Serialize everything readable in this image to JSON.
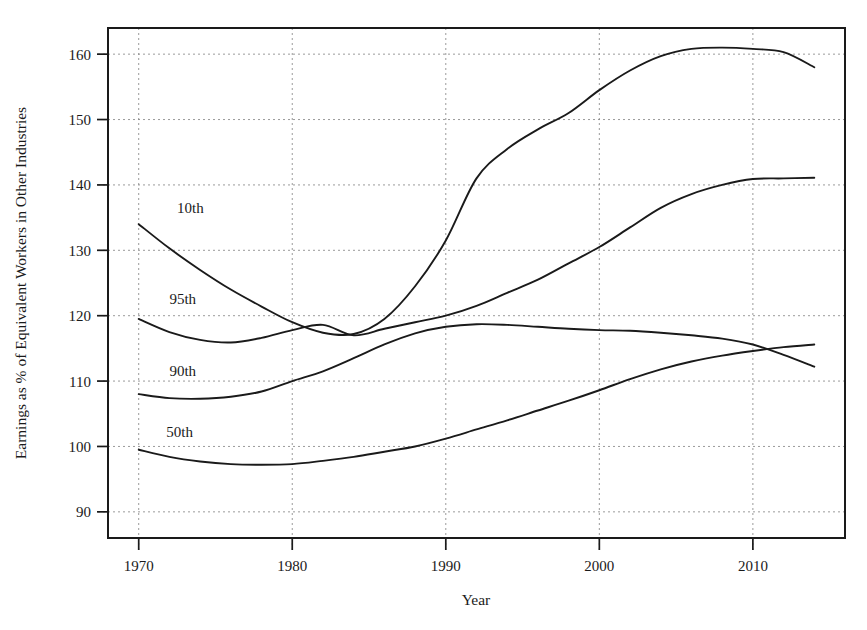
{
  "chart_data": {
    "type": "line",
    "title": "",
    "subtitle": "",
    "xlabel": "Year",
    "ylabel": "Earnings as % of Equivalent Workers in Other Industries",
    "xlim": [
      1968,
      2016
    ],
    "ylim": [
      86,
      164
    ],
    "xticks": [
      1970,
      1980,
      1990,
      2000,
      2010
    ],
    "xticklabels": [
      "1970",
      "1980",
      "1990",
      "2000",
      "2010"
    ],
    "yticks": [
      90,
      100,
      110,
      120,
      130,
      140,
      150,
      160
    ],
    "yticklabels": [
      "90",
      "100",
      "110",
      "120",
      "130",
      "140",
      "150",
      "160"
    ],
    "grid": true,
    "grid_style": "dotted",
    "legend": "inline-labels",
    "line_color": "#1a1a1a",
    "x": [
      1970,
      1972,
      1974,
      1976,
      1978,
      1980,
      1982,
      1984,
      1986,
      1988,
      1990,
      1992,
      1994,
      1996,
      1998,
      2000,
      2002,
      2004,
      2006,
      2008,
      2010,
      2012,
      2014
    ],
    "series": [
      {
        "name": "10th",
        "label": "10th",
        "label_x": 1972.5,
        "label_y": 136.5,
        "values": [
          134.0,
          130.3,
          127.0,
          124.0,
          121.4,
          119.0,
          117.4,
          117.2,
          119.5,
          124.5,
          131.5,
          141.0,
          145.5,
          148.5,
          151.0,
          154.5,
          157.5,
          159.7,
          160.8,
          161.0,
          160.8,
          160.3,
          158.0
        ]
      },
      {
        "name": "95th",
        "label": "95th",
        "label_x": 1972.0,
        "label_y": 122.5,
        "values": [
          119.5,
          117.5,
          116.3,
          115.9,
          116.6,
          117.8,
          118.6,
          117.0,
          118.0,
          119.0,
          120.0,
          121.5,
          123.5,
          125.5,
          128.0,
          130.5,
          133.5,
          136.5,
          138.6,
          140.0,
          140.9,
          141.0,
          141.1
        ]
      },
      {
        "name": "90th",
        "label": "90th",
        "label_x": 1972.0,
        "label_y": 111.5,
        "values": [
          108.0,
          107.4,
          107.3,
          107.6,
          108.4,
          110.0,
          111.5,
          113.5,
          115.6,
          117.3,
          118.3,
          118.7,
          118.6,
          118.3,
          118.0,
          117.8,
          117.7,
          117.4,
          117.0,
          116.5,
          115.6,
          114.0,
          112.2
        ]
      },
      {
        "name": "50th",
        "label": "50th",
        "label_x": 1971.8,
        "label_y": 102.2,
        "values": [
          99.5,
          98.4,
          97.7,
          97.3,
          97.2,
          97.3,
          97.8,
          98.4,
          99.2,
          100.0,
          101.2,
          102.6,
          104.0,
          105.5,
          107.0,
          108.6,
          110.3,
          111.8,
          113.0,
          113.9,
          114.6,
          115.2,
          115.6
        ]
      }
    ]
  },
  "plot_box": {
    "left": 108,
    "right": 845,
    "top": 28,
    "bottom": 538
  }
}
